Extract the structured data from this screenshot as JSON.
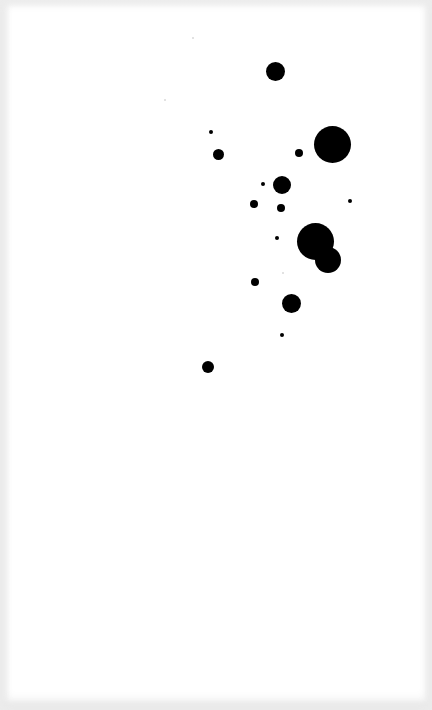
{
  "image": {
    "description": "Black circular dots of varying sizes scattered on a white sheet",
    "background_color": "#ffffff",
    "dot_color": "#000000",
    "edge_shade_color": "#eeeeee"
  },
  "dots": [
    {
      "cx": 275,
      "cy": 71,
      "r": 9.5
    },
    {
      "cx": 211,
      "cy": 132,
      "r": 2
    },
    {
      "cx": 218,
      "cy": 154,
      "r": 5.5
    },
    {
      "cx": 299,
      "cy": 153,
      "r": 4
    },
    {
      "cx": 332,
      "cy": 144,
      "r": 18.5
    },
    {
      "cx": 263,
      "cy": 184,
      "r": 2
    },
    {
      "cx": 282,
      "cy": 185,
      "r": 9
    },
    {
      "cx": 254,
      "cy": 204,
      "r": 4
    },
    {
      "cx": 281,
      "cy": 208,
      "r": 4
    },
    {
      "cx": 350,
      "cy": 201,
      "r": 2
    },
    {
      "cx": 277,
      "cy": 238,
      "r": 2
    },
    {
      "cx": 315,
      "cy": 241,
      "r": 18.5
    },
    {
      "cx": 328,
      "cy": 260,
      "r": 13
    },
    {
      "cx": 255,
      "cy": 282,
      "r": 4
    },
    {
      "cx": 291,
      "cy": 303,
      "r": 9.5
    },
    {
      "cx": 282,
      "cy": 335,
      "r": 2
    },
    {
      "cx": 208,
      "cy": 367,
      "r": 6
    }
  ],
  "specks": [
    {
      "cx": 165,
      "cy": 100,
      "r": 1
    },
    {
      "cx": 193,
      "cy": 38,
      "r": 1
    },
    {
      "cx": 283,
      "cy": 273,
      "r": 1
    }
  ]
}
